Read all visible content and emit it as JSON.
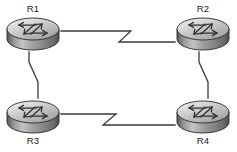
{
  "diagram": {
    "type": "network-topology",
    "background_color": "#ffffff",
    "line_color": "#3a3a3a",
    "label_color": "#1a1a1a",
    "router_top_color": "#d9d9d9",
    "router_body_color": "#8a8a8a",
    "router_outline_color": "#2b2b2b",
    "nodes": [
      {
        "id": "R1",
        "label": "R1",
        "icon": "router-icon",
        "cx": 33,
        "cy": 33,
        "label_x": 33,
        "label_y": 9,
        "label_position": "above"
      },
      {
        "id": "R2",
        "label": "R2",
        "icon": "router-icon",
        "cx": 203,
        "cy": 33,
        "label_x": 203,
        "label_y": 9,
        "label_position": "above"
      },
      {
        "id": "R3",
        "label": "R3",
        "icon": "router-icon",
        "cx": 33,
        "cy": 116,
        "label_x": 33,
        "label_y": 141,
        "label_position": "below"
      },
      {
        "id": "R4",
        "label": "R4",
        "icon": "router-icon",
        "cx": 203,
        "cy": 116,
        "label_x": 203,
        "label_y": 141,
        "label_position": "below"
      }
    ],
    "links": [
      {
        "id": "link-r1-r2",
        "from": "R1",
        "to": "R2",
        "orientation": "horizontal",
        "style": "serial-zigzag",
        "zigzag_symbol": "Z",
        "path": "M 61 31 L 131 31 L 119 42 L 175 42"
      },
      {
        "id": "link-r3-r4",
        "from": "R3",
        "to": "R4",
        "orientation": "horizontal",
        "style": "serial-zigzag",
        "zigzag_symbol": "Z",
        "path": "M 61 114 L 116 114 L 103 125 L 175 125"
      },
      {
        "id": "link-r1-r3",
        "from": "R1",
        "to": "R3",
        "orientation": "vertical",
        "style": "serial-zigzag",
        "zigzag_symbol": "N",
        "path": "M 29 52 L 29 62 L 38 82 L 38 98"
      },
      {
        "id": "link-r2-r4",
        "from": "R2",
        "to": "R4",
        "orientation": "vertical",
        "style": "serial-zigzag",
        "zigzag_symbol": "N",
        "path": "M 199 52 L 199 62 L 208 82 L 208 98"
      }
    ]
  }
}
